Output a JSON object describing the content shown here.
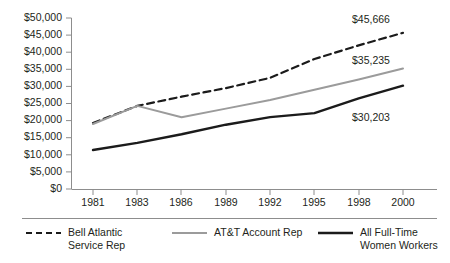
{
  "chart_data": {
    "type": "line",
    "title": "",
    "subtitle": "",
    "xlabel": "",
    "ylabel": "",
    "categories": [
      "1981",
      "1983",
      "1986",
      "1989",
      "1992",
      "1995",
      "1998",
      "2000"
    ],
    "ylim": [
      0,
      50000
    ],
    "ytick_step": 5000,
    "ytick_labels": [
      "$0",
      "$5,000",
      "$10,000",
      "$15,000",
      "$20,000",
      "$25,000",
      "$30,000",
      "$35,000",
      "$40,000",
      "$45,000",
      "$50,000"
    ],
    "ytick_values": [
      0,
      5000,
      10000,
      15000,
      20000,
      25000,
      30000,
      35000,
      40000,
      45000,
      50000
    ],
    "grid": false,
    "legend_position": "bottom",
    "series": [
      {
        "name": "Bell Atlantic Service Rep",
        "style": "dashed",
        "color": "#1b1b1b",
        "values": [
          19300,
          24300,
          27000,
          29500,
          32500,
          38000,
          42000,
          45666
        ],
        "end_label": "$45,666"
      },
      {
        "name": "AT&T Account Rep",
        "style": "solid",
        "color": "#9b9b9b",
        "values": [
          19000,
          24300,
          21000,
          23500,
          26000,
          29000,
          32000,
          35235
        ],
        "end_label": "$35,235"
      },
      {
        "name": "All Full-Time Women Workers",
        "style": "solid",
        "color": "#1b1b1b",
        "values": [
          11400,
          13500,
          16000,
          18800,
          21000,
          22200,
          26500,
          30203
        ],
        "end_label": "$30,203"
      }
    ],
    "annotations": [
      {
        "text": "$45,666",
        "series": "Bell Atlantic Service Rep"
      },
      {
        "text": "$35,235",
        "series": "AT&T Account Rep"
      },
      {
        "text": "$30,203",
        "series": "All Full-Time Women Workers"
      }
    ]
  },
  "axis": {
    "y_ticks": [
      {
        "label": "$50,000"
      },
      {
        "label": "$45,000"
      },
      {
        "label": "$40,000"
      },
      {
        "label": "$35,000"
      },
      {
        "label": "$30,000"
      },
      {
        "label": "$25,000"
      },
      {
        "label": "$20,000"
      },
      {
        "label": "$15,000"
      },
      {
        "label": "$10,000"
      },
      {
        "label": "$5,000"
      },
      {
        "label": "$0"
      }
    ],
    "x_ticks": [
      {
        "label": "1981"
      },
      {
        "label": "1983"
      },
      {
        "label": "1986"
      },
      {
        "label": "1989"
      },
      {
        "label": "1992"
      },
      {
        "label": "1995"
      },
      {
        "label": "1998"
      },
      {
        "label": "2000"
      }
    ]
  },
  "labels": {
    "bell_end": "$45,666",
    "atnt_end": "$35,235",
    "women_end": "$30,203"
  },
  "legend": {
    "items": [
      {
        "line1": "Bell Atlantic",
        "line2": "Service Rep",
        "swatch": "dashed-line-icon"
      },
      {
        "line1": "AT&T Account Rep",
        "line2": "",
        "swatch": "gray-line-icon"
      },
      {
        "line1": "All Full-Time",
        "line2": "Women Workers",
        "swatch": "black-line-icon"
      }
    ]
  }
}
